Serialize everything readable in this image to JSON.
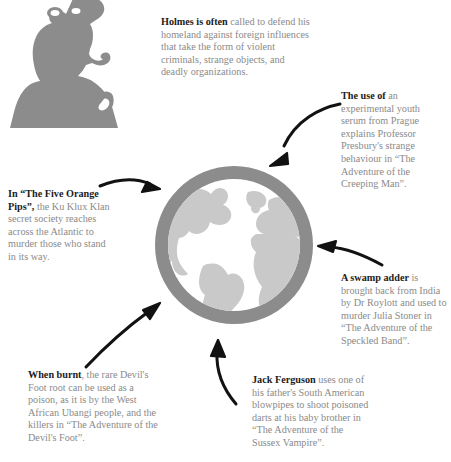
{
  "graphic": {
    "title": "Sherlock Holmes foreign threats infographic",
    "colors": {
      "silhouette": "#8c8c8c",
      "globe_ring": "#8c8c8c",
      "globe_ocean": "#ffffff",
      "globe_land": "#c9c9c9",
      "arrow": "#121212",
      "body_text": "#8a8a8a",
      "lead_text": "#1c1c1c",
      "background": "#ffffff"
    },
    "silhouette_name": "sherlock-holmes-silhouette",
    "globe_name": "globe-graphic"
  },
  "blurbs": {
    "intro": {
      "lead": "Holmes is often",
      "body": " called to defend his homeland against foreign influences that take the form of violent criminals, strange objects, and deadly organizations."
    },
    "creeping_man": {
      "lead": "The use of",
      "body": " an experimental youth serum from Prague explains Professor Presbury's strange behaviour in “The Adventure of the Creeping Man”."
    },
    "orange_pips": {
      "lead": "In “The Five Orange Pips”,",
      "body": " the Ku Klux Klan secret society reaches across the Atlantic to murder those who stand in its way."
    },
    "speckled_band": {
      "lead": "A swamp adder",
      "body": " is brought back from India by Dr Roylott and used to murder Julia Stoner in “The Adventure of the Speckled Band”."
    },
    "devils_foot": {
      "lead": "When burnt",
      "body": ", the rare Devil's Foot root can be used as a poison, as it is by the West African Ubangi people, and the killers in “The Adventure of the Devil's Foot”."
    },
    "sussex_vampire": {
      "lead": "Jack Ferguson",
      "body": " uses one of his father's South American blowpipes to shoot poisoned darts at his baby brother in “The Adventure of the Sussex Vampire”."
    }
  },
  "arrows": [
    {
      "name": "arrow-creeping-man",
      "from": "top-right",
      "to": "globe"
    },
    {
      "name": "arrow-orange-pips",
      "from": "left",
      "to": "globe"
    },
    {
      "name": "arrow-speckled-band",
      "from": "right",
      "to": "globe"
    },
    {
      "name": "arrow-devils-foot",
      "from": "bottom-left",
      "to": "globe"
    },
    {
      "name": "arrow-sussex-vampire",
      "from": "bottom-center",
      "to": "globe"
    }
  ]
}
